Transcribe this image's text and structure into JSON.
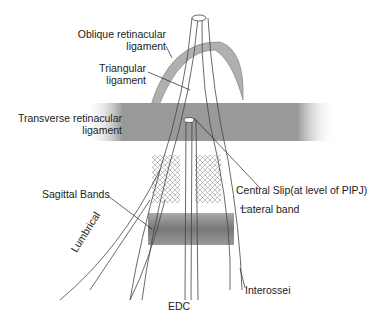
{
  "diagram": {
    "type": "anatomical-illustration",
    "colors": {
      "ink": "#3a3a3a",
      "band": "#8a8a8a",
      "band_light": "#c8c8c8",
      "background": "#ffffff"
    },
    "labels": {
      "oblique_1": "Oblique retinacular",
      "oblique_2": "ligament",
      "triangular_1": "Triangular",
      "triangular_2": "ligament",
      "transverse_1": "Transverse retinacular",
      "transverse_2": "ligament",
      "central_slip": "Central Slip(at level of PIPJ)",
      "lateral_band": "Lateral band",
      "sagittal_bands": "Sagittal Bands",
      "lumbrical": "Lumbrical",
      "edc": "EDC",
      "interossei": "Interossei"
    }
  }
}
